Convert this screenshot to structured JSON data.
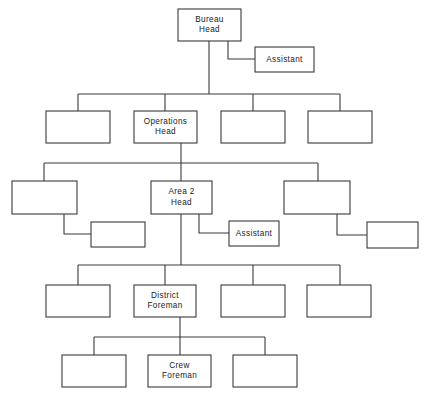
{
  "diagram": {
    "type": "org-chart",
    "canvas": {
      "width": 431,
      "height": 403
    },
    "style": {
      "box_fill": "#ffffff",
      "box_stroke": "#3a3a3a",
      "line_color": "#3a3a3a",
      "text_color": "#1a1a1a",
      "background": "#ffffff"
    },
    "nodes": [
      {
        "id": "bureau-head",
        "name": "bureau-head-box",
        "lines": [
          "Bureau",
          "Head"
        ],
        "x": 178,
        "y": 9,
        "w": 63,
        "h": 32,
        "level": 1,
        "labeled": true
      },
      {
        "id": "bureau-assistant",
        "name": "bureau-assistant-box",
        "lines": [
          "Assistant"
        ],
        "x": 255,
        "y": 47,
        "w": 59,
        "h": 25,
        "level": 1,
        "labeled": true
      },
      {
        "id": "div-1",
        "name": "division-box-1",
        "lines": [],
        "x": 46,
        "y": 111,
        "w": 64,
        "h": 32,
        "level": 2,
        "labeled": false
      },
      {
        "id": "operations-head",
        "name": "operations-head-box",
        "lines": [
          "Operations",
          "Head"
        ],
        "x": 134,
        "y": 111,
        "w": 63,
        "h": 32,
        "level": 2,
        "labeled": true
      },
      {
        "id": "div-3",
        "name": "division-box-3",
        "lines": [],
        "x": 221,
        "y": 111,
        "w": 64,
        "h": 32,
        "level": 2,
        "labeled": false
      },
      {
        "id": "div-4",
        "name": "division-box-4",
        "lines": [],
        "x": 308,
        "y": 111,
        "w": 64,
        "h": 32,
        "level": 2,
        "labeled": false
      },
      {
        "id": "area-1",
        "name": "area-box-1",
        "lines": [],
        "x": 12,
        "y": 181,
        "w": 65,
        "h": 33,
        "level": 3,
        "labeled": false
      },
      {
        "id": "area-1-assistant",
        "name": "area-1-assistant-box",
        "lines": [],
        "x": 91,
        "y": 222,
        "w": 54,
        "h": 25,
        "level": 3,
        "labeled": false
      },
      {
        "id": "area-2-head",
        "name": "area-2-head-box",
        "lines": [
          "Area 2",
          "Head"
        ],
        "x": 151,
        "y": 181,
        "w": 61,
        "h": 33,
        "level": 3,
        "labeled": true
      },
      {
        "id": "area-2-assistant",
        "name": "area-2-assistant-box",
        "lines": [
          "Assistant"
        ],
        "x": 229,
        "y": 221,
        "w": 50,
        "h": 25,
        "level": 3,
        "labeled": true
      },
      {
        "id": "area-3",
        "name": "area-box-3",
        "lines": [],
        "x": 284,
        "y": 181,
        "w": 66,
        "h": 33,
        "level": 3,
        "labeled": false
      },
      {
        "id": "area-3-assistant",
        "name": "area-3-assistant-box",
        "lines": [],
        "x": 367,
        "y": 222,
        "w": 51,
        "h": 26,
        "level": 3,
        "labeled": false
      },
      {
        "id": "district-1",
        "name": "district-box-1",
        "lines": [],
        "x": 46,
        "y": 285,
        "w": 64,
        "h": 32,
        "level": 4,
        "labeled": false
      },
      {
        "id": "district-foreman",
        "name": "district-foreman-box",
        "lines": [
          "District",
          "Foreman"
        ],
        "x": 134,
        "y": 285,
        "w": 62,
        "h": 32,
        "level": 4,
        "labeled": true
      },
      {
        "id": "district-3",
        "name": "district-box-3",
        "lines": [],
        "x": 221,
        "y": 285,
        "w": 64,
        "h": 32,
        "level": 4,
        "labeled": false
      },
      {
        "id": "district-4",
        "name": "district-box-4",
        "lines": [],
        "x": 307,
        "y": 285,
        "w": 64,
        "h": 32,
        "level": 4,
        "labeled": false
      },
      {
        "id": "crew-1",
        "name": "crew-box-1",
        "lines": [],
        "x": 62,
        "y": 355,
        "w": 64,
        "h": 32,
        "level": 5,
        "labeled": false
      },
      {
        "id": "crew-foreman",
        "name": "crew-foreman-box",
        "lines": [
          "Crew",
          "Foreman"
        ],
        "x": 148,
        "y": 355,
        "w": 63,
        "h": 32,
        "level": 5,
        "labeled": true
      },
      {
        "id": "crew-3",
        "name": "crew-box-3",
        "lines": [],
        "x": 233,
        "y": 355,
        "w": 64,
        "h": 32,
        "level": 5,
        "labeled": false
      }
    ],
    "connectors": [
      {
        "name": "bureau-to-assistant-elbow",
        "points": "228,41 228,59 255,59"
      },
      {
        "name": "bureau-head-trunk",
        "points": "209,41 209,94"
      },
      {
        "name": "level2-bus",
        "points": "78,94 340,94"
      },
      {
        "name": "level2-drop-1",
        "points": "78,94 78,111"
      },
      {
        "name": "level2-drop-2",
        "points": "165,94 165,111"
      },
      {
        "name": "level2-drop-3",
        "points": "253,94 253,111"
      },
      {
        "name": "level2-drop-4",
        "points": "340,94 340,111"
      },
      {
        "name": "operations-head-trunk",
        "points": "181,143 181,163"
      },
      {
        "name": "level3-bus",
        "points": "44,163 318,163"
      },
      {
        "name": "level3-drop-1",
        "points": "44,163 44,181"
      },
      {
        "name": "level3-drop-2",
        "points": "181,163 181,181"
      },
      {
        "name": "level3-drop-3",
        "points": "318,163 318,181"
      },
      {
        "name": "area-1-to-assistant-elbow",
        "points": "64,214 64,234 91,234"
      },
      {
        "name": "area-2-to-assistant-elbow",
        "points": "199,214 199,233 229,233"
      },
      {
        "name": "area-3-to-assistant-elbow",
        "points": "337,214 337,235 367,235"
      },
      {
        "name": "area-2-head-trunk",
        "points": "181,214 181,265"
      },
      {
        "name": "level4-bus",
        "points": "78,265 340,265"
      },
      {
        "name": "level4-drop-1",
        "points": "78,265 78,285"
      },
      {
        "name": "level4-drop-2",
        "points": "165,265 165,285"
      },
      {
        "name": "level4-drop-3",
        "points": "253,265 253,285"
      },
      {
        "name": "level4-drop-4",
        "points": "340,265 340,285"
      },
      {
        "name": "district-foreman-trunk",
        "points": "180,317 180,337"
      },
      {
        "name": "level5-bus",
        "points": "94,337 265,337"
      },
      {
        "name": "level5-drop-1",
        "points": "94,337 94,355"
      },
      {
        "name": "level5-drop-2",
        "points": "180,337 180,355"
      },
      {
        "name": "level5-drop-3",
        "points": "265,337 265,355"
      }
    ]
  }
}
